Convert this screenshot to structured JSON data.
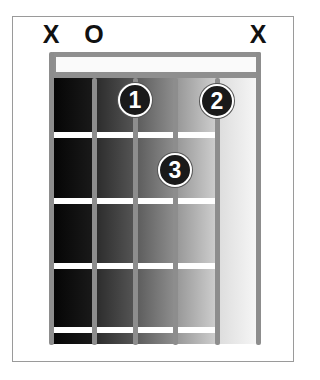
{
  "chord_diagram": {
    "string_markers": [
      {
        "string": 1,
        "label": "X",
        "x": 51
      },
      {
        "string": 2,
        "label": "O",
        "x": 94
      },
      {
        "string": 6,
        "label": "X",
        "x": 258
      }
    ],
    "strings": [
      51,
      94,
      135,
      175,
      217,
      258
    ],
    "frets_y": [
      135,
      201,
      266,
      330
    ],
    "fingers": [
      {
        "label": "1",
        "string": 3,
        "fret": 1,
        "x": 135,
        "y": 100
      },
      {
        "label": "2",
        "string": 5,
        "fret": 1,
        "x": 217,
        "y": 101
      },
      {
        "label": "3",
        "string": 4,
        "fret": 2,
        "x": 175,
        "y": 170
      }
    ],
    "column_shades": [
      "#0e0e0e",
      "#3a3a3a",
      "#6f6f6f",
      "#a8a8a8",
      "#e6e6e6"
    ],
    "colors": {
      "frame": "#9a9a9a",
      "string": "#8d8d8d",
      "fret": "#ffffff",
      "dot_fill": "#1a1a1a",
      "dot_text": "#ffffff",
      "marker_text": "#111111"
    }
  }
}
